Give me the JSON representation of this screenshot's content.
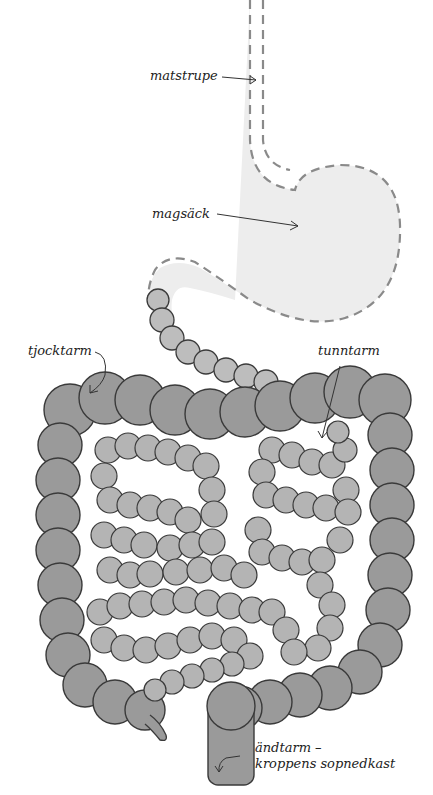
{
  "labels": {
    "esophagus": "matstrupe",
    "stomach": "magsäck",
    "large_intestine": "tjocktarm",
    "small_intestine": "tunntarm",
    "rectum_line1": "ändtarm –",
    "rectum_line2": "kroppens sopnedkast"
  },
  "colors": {
    "large_intestine": "#9a9a9a",
    "small_intestine": "#b4b4b4",
    "stomach_fill": "#ededed",
    "outline": "#3a3a3a",
    "dash": "#8a8a8a",
    "text": "#222222"
  }
}
